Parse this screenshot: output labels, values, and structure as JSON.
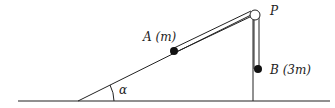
{
  "diagram": {
    "labels": {
      "pulley": "P",
      "mass_a": "A (m)",
      "mass_b": "B (3m)",
      "angle": "α"
    },
    "colors": {
      "stroke": "#222222",
      "mass": "#111111",
      "background": "#ffffff"
    }
  }
}
